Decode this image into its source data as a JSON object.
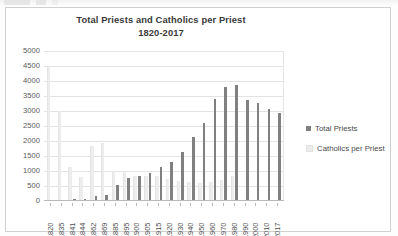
{
  "chart_data": {
    "type": "bar",
    "title": "Total Priests and Catholics per Priest",
    "subtitle": "1820-2017",
    "xlabel": "",
    "ylabel": "",
    "ylim": [
      0,
      5000
    ],
    "ytick_labels": [
      "5000",
      "4500",
      "4000",
      "3500",
      "3000",
      "2500",
      "2000",
      "1500",
      "1000",
      "500",
      "0"
    ],
    "ytick_values": [
      5000,
      4500,
      4000,
      3500,
      3000,
      2500,
      2000,
      1500,
      1000,
      500,
      0
    ],
    "grid": true,
    "legend_position": "right",
    "categories": [
      "1820",
      "1835",
      "1841",
      "1844",
      "1862",
      "1869",
      "1885",
      "1895",
      "1900",
      "1905",
      "1915",
      "1920",
      "1930",
      "1940",
      "1950",
      "1960",
      "1970",
      "1980",
      "1990",
      "2000",
      "2010",
      "2017"
    ],
    "series": [
      {
        "name": "Total Priests",
        "color": "#808080",
        "values": [
          20,
          40,
          60,
          70,
          170,
          200,
          520,
          760,
          830,
          940,
          1140,
          1310,
          1630,
          2120,
          2590,
          3400,
          3800,
          3870,
          3380,
          3280,
          3080,
          2920
        ]
      },
      {
        "name": "Catholics per Priest",
        "color": "#ececec",
        "values": [
          4500,
          3000,
          1150,
          800,
          1850,
          1950,
          1000,
          1000,
          850,
          830,
          830,
          720,
          680,
          620,
          600,
          620,
          700,
          850,
          0,
          0,
          0,
          0
        ]
      }
    ]
  },
  "legend": {
    "items": [
      {
        "label": "Total Priests"
      },
      {
        "label": "Catholics per Priest"
      }
    ]
  }
}
